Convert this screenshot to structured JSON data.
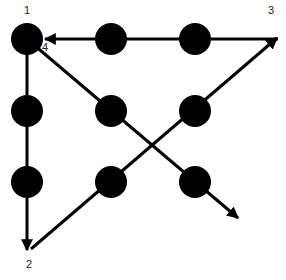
{
  "diagram": {
    "colors": {
      "background": "#ffffff",
      "ink": "#000000",
      "label": "#222222"
    },
    "dots": [
      {
        "id": "r1c1",
        "cx": 27,
        "cy": 39,
        "r": 16
      },
      {
        "id": "r1c2",
        "cx": 111,
        "cy": 39,
        "r": 16
      },
      {
        "id": "r1c3",
        "cx": 195,
        "cy": 39,
        "r": 16
      },
      {
        "id": "r2c1",
        "cx": 27,
        "cy": 111,
        "r": 16
      },
      {
        "id": "r2c2",
        "cx": 111,
        "cy": 111,
        "r": 16
      },
      {
        "id": "r2c3",
        "cx": 195,
        "cy": 111,
        "r": 16
      },
      {
        "id": "r3c1",
        "cx": 27,
        "cy": 182,
        "r": 16
      },
      {
        "id": "r3c2",
        "cx": 111,
        "cy": 182,
        "r": 16
      },
      {
        "id": "r3c3",
        "cx": 195,
        "cy": 182,
        "r": 16
      }
    ],
    "strokes": [
      {
        "id": "stroke-1-to-2",
        "x1": 27,
        "y1": 39,
        "x2": 27,
        "y2": 250
      },
      {
        "id": "stroke-2-to-3",
        "x1": 31,
        "y1": 249,
        "x2": 277,
        "y2": 38
      },
      {
        "id": "stroke-3-to-4",
        "x1": 278,
        "y1": 39,
        "x2": 45,
        "y2": 39
      },
      {
        "id": "stroke-4-to-end",
        "x1": 27,
        "y1": 39,
        "x2": 238,
        "y2": 218
      }
    ],
    "labels": [
      {
        "id": "label-1",
        "text": "1",
        "x": 24,
        "y": 14
      },
      {
        "id": "label-2",
        "text": "2",
        "x": 26,
        "y": 268
      },
      {
        "id": "label-3",
        "text": "3",
        "x": 268,
        "y": 14
      },
      {
        "id": "label-4",
        "text": "4",
        "x": 42,
        "y": 51
      }
    ]
  }
}
